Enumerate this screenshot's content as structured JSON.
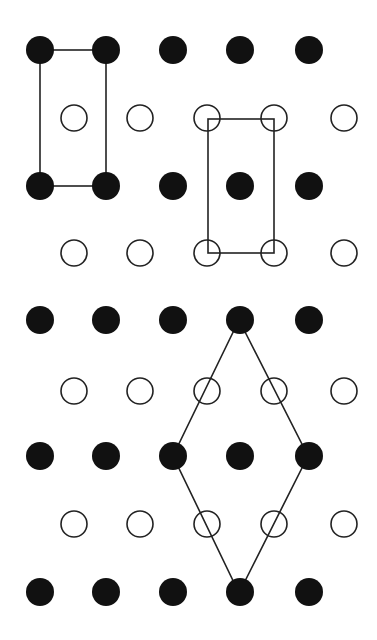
{
  "figure": {
    "width": 377,
    "height": 640,
    "colors": {
      "background": "#ffffff",
      "filled": "#111111",
      "stroke": "#222222"
    },
    "dot_radius": 14,
    "filled_rows": [
      {
        "y": 50,
        "x": [
          40,
          106,
          173,
          240,
          309
        ]
      },
      {
        "y": 186,
        "x": [
          40,
          106,
          173,
          240,
          309
        ]
      },
      {
        "y": 320,
        "x": [
          40,
          106,
          173,
          240,
          309
        ]
      },
      {
        "y": 456,
        "x": [
          40,
          106,
          173,
          240,
          309
        ]
      },
      {
        "y": 592,
        "x": [
          40,
          106,
          173,
          240,
          309
        ]
      }
    ],
    "open_rows": [
      {
        "y": 118,
        "x": [
          74,
          140,
          207,
          274,
          344
        ]
      },
      {
        "y": 253,
        "x": [
          74,
          140,
          207,
          274,
          344
        ]
      },
      {
        "y": 391,
        "x": [
          74,
          140,
          207,
          274,
          344
        ]
      },
      {
        "y": 524,
        "x": [
          74,
          140,
          207,
          274,
          344
        ]
      }
    ],
    "cells": [
      {
        "name": "rectangular-cell-corners-filled",
        "type": "rect",
        "x": 40,
        "y": 50,
        "w": 66,
        "h": 136
      },
      {
        "name": "rectangular-cell-corners-open",
        "type": "rect",
        "x": 208,
        "y": 119,
        "w": 66,
        "h": 134
      },
      {
        "name": "rhombic-primitive-cell",
        "type": "polygon",
        "points": [
          [
            239,
            320
          ],
          [
            308,
            456
          ],
          [
            239,
            593
          ],
          [
            173,
            456
          ]
        ]
      }
    ]
  }
}
